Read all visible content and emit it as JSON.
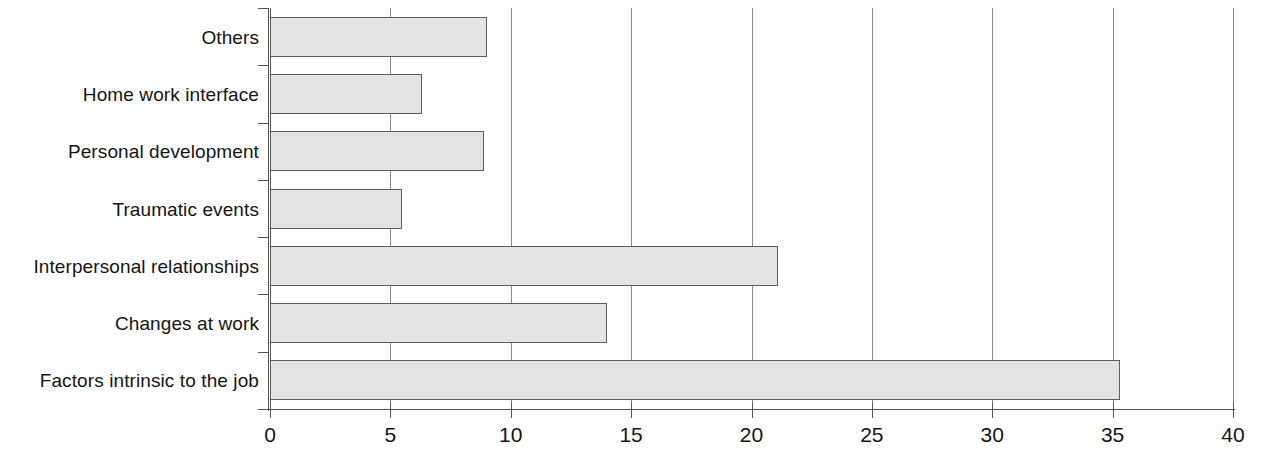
{
  "chart_data": {
    "type": "bar",
    "orientation": "horizontal",
    "title": "",
    "subtitle": "",
    "xlabel": "",
    "ylabel": "",
    "categories": [
      "Others",
      "Home work interface",
      "Personal development",
      "Traumatic events",
      "Interpersonal relationships",
      "Changes at work",
      "Factors intrinsic to the job"
    ],
    "values": [
      9.0,
      6.3,
      8.9,
      5.5,
      21.1,
      14.0,
      35.3
    ],
    "series": [
      {
        "name": "",
        "values": [
          9.0,
          6.3,
          8.9,
          5.5,
          21.1,
          14.0,
          35.3
        ]
      }
    ],
    "xlim": [
      0,
      40
    ],
    "xticks": [
      0,
      5,
      10,
      15,
      20,
      25,
      30,
      35,
      40
    ],
    "xtick_labels": [
      "0",
      "5",
      "10",
      "15",
      "20",
      "25",
      "30",
      "35",
      "40"
    ],
    "grid": "vertical",
    "legend": "none",
    "bar_fill_color": "#e3e3e3",
    "bar_edge_color": "#5e5e5e",
    "axis_color": "#555555",
    "gridline_color": "#8a8a8a",
    "background_color": "#ffffff",
    "text_color": "#141414"
  }
}
